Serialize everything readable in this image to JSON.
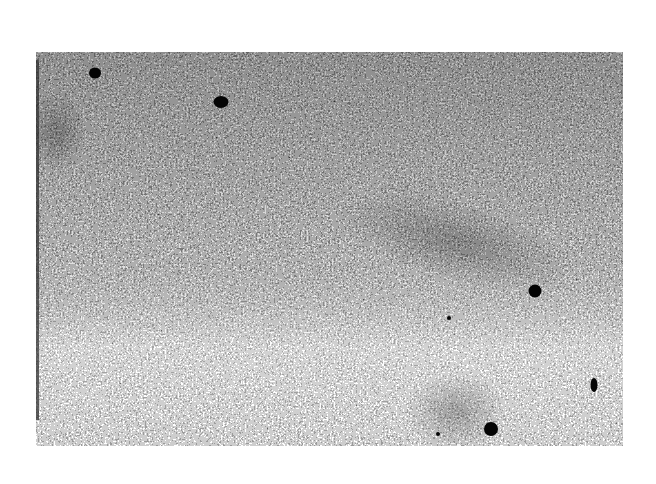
{
  "image": {
    "description": "Grainy grayscale micrograph with scattered dark electron-dense particles",
    "background_color": "#ffffff",
    "texture_base_color": "#8a8a8a",
    "frame": {
      "x": 36,
      "y": 52,
      "width": 587,
      "height": 394
    },
    "particles": [
      {
        "x": 95,
        "y": 73,
        "w": 12,
        "h": 11
      },
      {
        "x": 221,
        "y": 102,
        "w": 15,
        "h": 12
      },
      {
        "x": 535,
        "y": 291,
        "w": 13,
        "h": 13
      },
      {
        "x": 491,
        "y": 429,
        "w": 14,
        "h": 14
      },
      {
        "x": 594,
        "y": 385,
        "w": 7,
        "h": 14
      },
      {
        "x": 449,
        "y": 318,
        "w": 4,
        "h": 4
      },
      {
        "x": 438,
        "y": 434,
        "w": 4,
        "h": 4
      }
    ],
    "density_regions": [
      {
        "name": "upper-dense",
        "x": 0,
        "y": 0,
        "w": 587,
        "h": 230,
        "opacity": 0.55
      },
      {
        "name": "lower-light",
        "x": 0,
        "y": 230,
        "w": 587,
        "h": 164,
        "opacity": 0.25
      }
    ]
  }
}
